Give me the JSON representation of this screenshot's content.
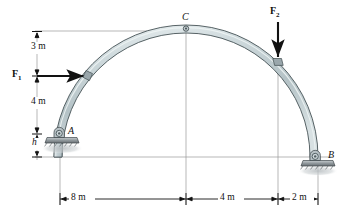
{
  "figure": {
    "type": "statics-free-body-diagram",
    "background_color": "#ffffff"
  },
  "labels": {
    "point_a": "A",
    "point_b": "B",
    "point_c": "C",
    "force_1": "F",
    "force_1_sub": "1",
    "force_2": "F",
    "force_2_sub": "2",
    "height_h": "h"
  },
  "dimensions": {
    "vertical": [
      {
        "text": "3 m",
        "value": 3,
        "unit": "m"
      },
      {
        "text": "4 m",
        "value": 4,
        "unit": "m"
      }
    ],
    "horizontal": [
      {
        "text": "8 m",
        "value": 8,
        "unit": "m"
      },
      {
        "text": "4 m",
        "value": 4,
        "unit": "m"
      },
      {
        "text": "2 m",
        "value": 2,
        "unit": "m"
      }
    ]
  },
  "colors": {
    "arch_fill": "#c2cfd2",
    "arch_fill_light": "#dfe7e8",
    "arch_stroke": "#39464a",
    "line": "#8e8e8e",
    "ink": "#121212",
    "support_dark": "#6d7478",
    "support_light": "#b9c0c3",
    "shadow": "#c9ced0"
  },
  "geometry": {
    "arch_center_x": 186,
    "arch_baseline_y": 157,
    "arch_outer_radius": 132,
    "arch_thickness": 8,
    "support_a_x": 60,
    "support_a_y": 134,
    "support_b_x": 318,
    "support_b_y": 157,
    "apex_c_x": 186,
    "apex_c_y": 26,
    "f1_y": 76,
    "f2_x": 278
  }
}
